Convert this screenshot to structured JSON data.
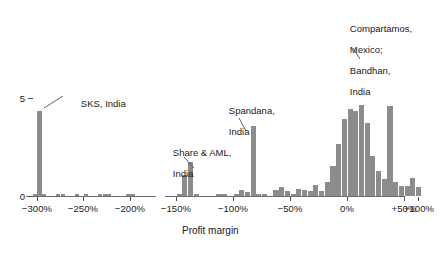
{
  "chart_data": {
    "type": "bar",
    "title": "",
    "subtitle": "",
    "xlabel": "Profit margin",
    "ylabel": "",
    "ylim": [
      0,
      5.6
    ],
    "xlim": [
      -320,
      110
    ],
    "grid": false,
    "legend": null,
    "bin_width_pct": 5,
    "axis_note": "horizontal axis is broken between -190% and -160%",
    "y_ticks": [
      "0",
      "5"
    ],
    "y_tick_values": [
      0,
      5
    ],
    "x_ticks": [
      "-300%",
      "-250%",
      "-200%",
      "-150%",
      "-100%",
      "-50%",
      "0%",
      "+50%",
      "+100%"
    ],
    "x_tick_values": [
      -300,
      -250,
      -200,
      -150,
      -100,
      -50,
      0,
      50,
      100
    ],
    "bar_color": "#8c8c8c",
    "axis_color": "#4d4d4d",
    "categories": [
      "-302",
      "-297",
      "-292",
      "-277",
      "-272",
      "-257",
      "-247",
      "-232",
      "-227",
      "-222",
      "-202",
      "-197",
      "-147",
      "-142",
      "-137",
      "-132",
      "-112",
      "-107",
      "-97",
      "-92",
      "-87",
      "-82",
      "-77",
      "-72",
      "-62",
      "-57",
      "-52",
      "-47",
      "-42",
      "-37",
      "-32",
      "-27",
      "-22",
      "-17",
      "-12",
      "-7",
      "-2",
      "3",
      "8",
      "13",
      "18",
      "23",
      "28",
      "33",
      "38",
      "43",
      "48",
      "53",
      "58",
      "63",
      "68"
    ],
    "values": [
      0.12,
      4.35,
      0.12,
      0.1,
      0.1,
      0.1,
      0.12,
      0.1,
      0.1,
      0.12,
      0.1,
      0.1,
      0.12,
      1.05,
      1.75,
      0.1,
      0.1,
      0.12,
      0.12,
      0.3,
      0.22,
      3.55,
      0.12,
      0.1,
      0.3,
      0.45,
      0.28,
      0.12,
      0.35,
      0.3,
      0.25,
      0.55,
      0.28,
      0.72,
      1.55,
      2.65,
      3.95,
      4.45,
      4.35,
      4.65,
      3.75,
      2.05,
      1.3,
      0.85,
      4.6,
      0.72,
      0.5,
      0.5,
      0.9,
      0.45,
      0.0
    ],
    "annotations": [
      {
        "label": "SKS, India",
        "value_pct": -297,
        "count": 4.35
      },
      {
        "label": "Share & AML,\nIndia",
        "value_pct": -140,
        "count": 1.75
      },
      {
        "label": "Spandana,\nIndia",
        "value_pct": -82,
        "count": 3.55
      },
      {
        "label": "Compartamos,\nMexico;\nBandhan,\nIndia",
        "value_pct": 38,
        "count": 4.6
      }
    ]
  },
  "axis": {
    "x_title": "Profit margin",
    "y_tick_0": "0",
    "y_tick_5": "5",
    "x_tick_0": "−300%",
    "x_tick_1": "−250%",
    "x_tick_2": "−200%",
    "x_tick_3": "−150%",
    "x_tick_4": "−100%",
    "x_tick_5": "−50%",
    "x_tick_6": "0%",
    "x_tick_7": "+50%",
    "x_tick_8": "+100%"
  },
  "annotations": {
    "sks": "SKS, India",
    "share_line1": "Share & AML,",
    "share_line2": "India",
    "spandana_line1": "Spandana,",
    "spandana_line2": "India",
    "compartamos_line1": "Compartamos,",
    "compartamos_line2": "Mexico;",
    "compartamos_line3": "Bandhan,",
    "compartamos_line4": "India"
  }
}
